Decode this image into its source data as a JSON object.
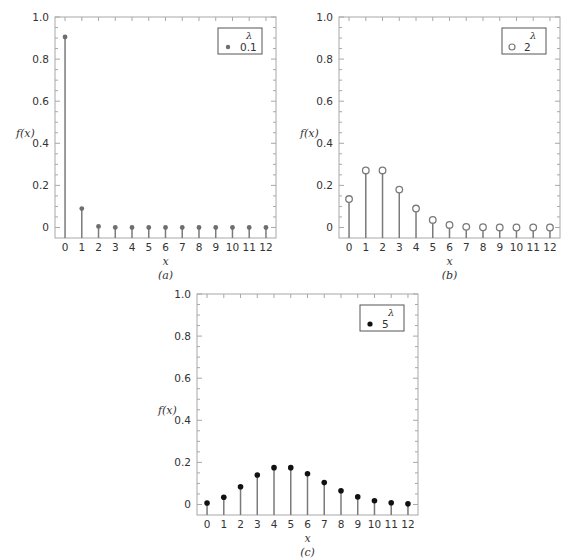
{
  "chart_data": [
    {
      "id": "a",
      "type": "stem",
      "title": "",
      "caption": "(a)",
      "xlabel": "x",
      "ylabel": "f(x)",
      "ylim": [
        -0.05,
        1.0
      ],
      "xlim": [
        -0.6,
        12.6
      ],
      "x": [
        0,
        1,
        2,
        3,
        4,
        5,
        6,
        7,
        8,
        9,
        10,
        11,
        12
      ],
      "y_ticks": [
        0,
        0.2,
        0.4,
        0.6,
        0.8,
        1.0
      ],
      "y_tick_labels": [
        "0",
        "0.2",
        "0.4",
        "0.6",
        "0.8",
        "1.0"
      ],
      "x_tick_labels": [
        "0",
        "1",
        "2",
        "3",
        "4",
        "5",
        "6",
        "7",
        "8",
        "9",
        "10",
        "11",
        "12"
      ],
      "legend": {
        "title": "λ",
        "entries": [
          "0.1"
        ],
        "position": "upper right"
      },
      "marker": "filled-gray",
      "series": [
        {
          "name": "0.1",
          "values": [
            0.905,
            0.09,
            0.005,
            0.0002,
            0,
            0,
            0,
            0,
            0,
            0,
            0,
            0,
            0
          ]
        }
      ]
    },
    {
      "id": "b",
      "type": "stem",
      "title": "",
      "caption": "(b)",
      "xlabel": "x",
      "ylabel": "f(x)",
      "ylim": [
        -0.05,
        1.0
      ],
      "xlim": [
        -0.6,
        12.6
      ],
      "x": [
        0,
        1,
        2,
        3,
        4,
        5,
        6,
        7,
        8,
        9,
        10,
        11,
        12
      ],
      "y_ticks": [
        0,
        0.2,
        0.4,
        0.6,
        0.8,
        1.0
      ],
      "y_tick_labels": [
        "0",
        "0.2",
        "0.4",
        "0.6",
        "0.8",
        "1.0"
      ],
      "x_tick_labels": [
        "0",
        "1",
        "2",
        "3",
        "4",
        "5",
        "6",
        "7",
        "8",
        "9",
        "10",
        "11",
        "12"
      ],
      "legend": {
        "title": "λ",
        "entries": [
          "2"
        ],
        "position": "upper right"
      },
      "marker": "open-circle",
      "series": [
        {
          "name": "2",
          "values": [
            0.135,
            0.271,
            0.271,
            0.18,
            0.09,
            0.036,
            0.012,
            0.003,
            0.001,
            0.0002,
            0,
            0,
            0
          ]
        }
      ]
    },
    {
      "id": "c",
      "type": "stem",
      "title": "",
      "caption": "(c)",
      "xlabel": "x",
      "ylabel": "f(x)",
      "ylim": [
        -0.05,
        1.0
      ],
      "xlim": [
        -0.6,
        12.6
      ],
      "x": [
        0,
        1,
        2,
        3,
        4,
        5,
        6,
        7,
        8,
        9,
        10,
        11,
        12
      ],
      "y_ticks": [
        0,
        0.2,
        0.4,
        0.6,
        0.8,
        1.0
      ],
      "y_tick_labels": [
        "0",
        "0.2",
        "0.4",
        "0.6",
        "0.8",
        "1.0"
      ],
      "x_tick_labels": [
        "0",
        "1",
        "2",
        "3",
        "4",
        "5",
        "6",
        "7",
        "8",
        "9",
        "10",
        "11",
        "12"
      ],
      "legend": {
        "title": "λ",
        "entries": [
          "5"
        ],
        "position": "upper right"
      },
      "marker": "filled-black",
      "series": [
        {
          "name": "5",
          "values": [
            0.007,
            0.034,
            0.084,
            0.14,
            0.175,
            0.175,
            0.146,
            0.104,
            0.065,
            0.036,
            0.018,
            0.008,
            0.003
          ]
        }
      ]
    }
  ],
  "panels": [
    {
      "caption": "(a)",
      "ylabel": "f(x)",
      "xlabel": "x",
      "legend_title": "λ",
      "legend_value": "0.1"
    },
    {
      "caption": "(b)",
      "ylabel": "f(x)",
      "xlabel": "x",
      "legend_title": "λ",
      "legend_value": "2"
    },
    {
      "caption": "(c)",
      "ylabel": "f(x)",
      "xlabel": "x",
      "legend_title": "λ",
      "legend_value": "5"
    }
  ],
  "colors": {
    "frame": "#a8a8a8",
    "stem_gray": "#7a7a7a",
    "marker_gray": "#6e6e6e",
    "marker_black": "#111111",
    "text": "#333333"
  }
}
